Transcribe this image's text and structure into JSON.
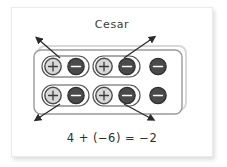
{
  "slide": {
    "title": "Cesar",
    "equation": "4 + (−6) = −2",
    "background_color": "#ffffff",
    "card_color": "#ffffff",
    "ink_color": "#3b3b3b"
  },
  "model": {
    "outer_box_label": "counter-mat",
    "inner_box_label": "counter-mat-inner",
    "positive_chip_symbol": "+",
    "negative_chip_symbol": "−",
    "positive_chip_fill": "#d9d9d9",
    "positive_chip_stroke": "#4a4a4a",
    "negative_chip_fill": "#4a4a4a",
    "negative_chip_stroke": "#2e2e2e",
    "zero_pair_ring_stroke": "#555555",
    "arrow_color": "#2b2b2b",
    "rows": [
      {
        "row_index": 1,
        "chips": [
          {
            "sign": "+",
            "in_zero_pair": true,
            "pair_id": 1
          },
          {
            "sign": "−",
            "in_zero_pair": true,
            "pair_id": 1
          },
          {
            "sign": "+",
            "in_zero_pair": true,
            "pair_id": 2
          },
          {
            "sign": "−",
            "in_zero_pair": true,
            "pair_id": 2
          },
          {
            "sign": "−",
            "in_zero_pair": false,
            "pair_id": null
          }
        ]
      },
      {
        "row_index": 2,
        "chips": [
          {
            "sign": "+",
            "in_zero_pair": true,
            "pair_id": 3
          },
          {
            "sign": "−",
            "in_zero_pair": true,
            "pair_id": 3
          },
          {
            "sign": "+",
            "in_zero_pair": true,
            "pair_id": 4
          },
          {
            "sign": "−",
            "in_zero_pair": true,
            "pair_id": 4
          },
          {
            "sign": "−",
            "in_zero_pair": false,
            "pair_id": null
          }
        ]
      }
    ],
    "zero_pair_count": 4,
    "arrows": [
      {
        "id": 1,
        "from_pair": 1,
        "direction": "up-left"
      },
      {
        "id": 2,
        "from_pair": 2,
        "direction": "up-right"
      },
      {
        "id": 3,
        "from_pair": 3,
        "direction": "down-left"
      },
      {
        "id": 4,
        "from_pair": 4,
        "direction": "down-right"
      }
    ],
    "positives_total": 4,
    "negatives_total": 6,
    "result": -2
  }
}
